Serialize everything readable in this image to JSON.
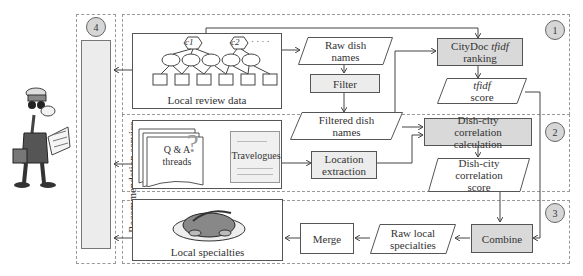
{
  "diagram": {
    "sections": [
      {
        "id": "1",
        "label": "1"
      },
      {
        "id": "2",
        "label": "2"
      },
      {
        "id": "3",
        "label": "3"
      },
      {
        "id": "4",
        "label": "4"
      }
    ],
    "recommendation_service": "Recommendation service",
    "local_review_data": {
      "label": "Local review data",
      "cities": [
        "c1",
        "c2"
      ],
      "reviews": [
        "r11",
        "r12",
        "r13",
        "r21",
        "r22"
      ],
      "dishes": [
        "d1",
        "d2",
        "d3",
        "d4",
        "d5",
        "d6"
      ],
      "ellipsis": "· · · ·"
    },
    "raw_dish_names": "Raw dish names",
    "filter": "Filter",
    "filtered_dish_names": "Filtered dish names",
    "citydoc_ranking": {
      "prefix": "CityDoc ",
      "italic": "tfidf",
      "suffix": " ranking"
    },
    "tfidf_score": {
      "italic": "tfidf",
      "suffix": "score"
    },
    "qa_threads": "Q & A threads",
    "question_mark": "?",
    "travelogues": "Travelogues",
    "location_extraction": "Location extraction",
    "dish_city_calc": "Dish-city correlation calculation",
    "dish_city_score": "Dish-city correlation score",
    "combine": "Combine",
    "raw_local_specialties": "Raw local specialties",
    "merge": "Merge",
    "local_specialties": "Local specialties"
  }
}
